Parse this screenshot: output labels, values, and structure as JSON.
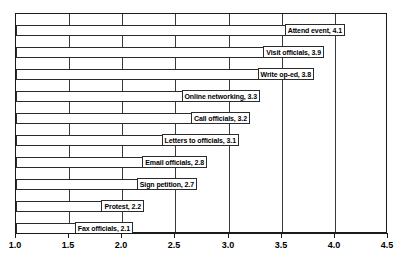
{
  "chart_data": {
    "type": "bar",
    "orientation": "horizontal",
    "title": "",
    "subtitle": "",
    "xlabel": "",
    "ylabel": "",
    "xlim": [
      1.0,
      4.5
    ],
    "xticks": [
      "1.0",
      "1.5",
      "2.0",
      "2.5",
      "3.0",
      "3.5",
      "4.0",
      "4.5"
    ],
    "xtick_values": [
      1.0,
      1.5,
      2.0,
      2.5,
      3.0,
      3.5,
      4.0,
      4.5
    ],
    "grid": "vertical",
    "legend": "none",
    "bar_baseline": 1.0,
    "categories": [
      "Attend event",
      "Visit officials",
      "Write op-ed",
      "Online networking",
      "Call officials",
      "Letters to officials",
      "Email officials",
      "Sign petition",
      "Protest",
      "Fax officials"
    ],
    "values": [
      4.1,
      3.9,
      3.8,
      3.3,
      3.2,
      3.1,
      2.8,
      2.7,
      2.2,
      2.1
    ],
    "point_labels": [
      "Attend event, 4.1",
      "Visit officials, 3.9",
      "Write op-ed, 3.8",
      "Online networking, 3.3",
      "Call officials, 3.2",
      "Letters to officials, 3.1",
      "Email officials, 2.8",
      "Sign petition, 2.7",
      "Protest, 2.2",
      "Fax officials, 2.1"
    ],
    "colors": {
      "bar_fill": "#ffffff",
      "bar_stroke": "#2b2b2b",
      "gridline": "#3a3a3a",
      "axis": "#1a1a1a",
      "label_text": "#000000",
      "background": "#ffffff"
    }
  }
}
